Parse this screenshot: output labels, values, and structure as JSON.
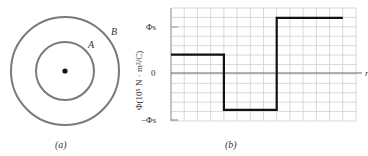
{
  "panel_a": {
    "caption": "(a)",
    "outer_label": "B",
    "inner_label": "A",
    "circle_color": "#777777"
  },
  "panel_b": {
    "caption": "(b)",
    "ylabel": "Φ(10⁵ N · m²/C)",
    "xlabel": "r",
    "ytick_top": "Φs",
    "ytick_zero": "0",
    "ytick_bottom": "−Φs"
  },
  "chart_data": {
    "type": "line",
    "title": "",
    "xlabel": "r",
    "ylabel": "Φ(10^5 N·m²/C)",
    "ytick_labels": [
      "-Φs",
      "0",
      "Φs"
    ],
    "ylim": [
      "-Φs",
      "1.4Φs"
    ],
    "grid": true,
    "step": true,
    "series": [
      {
        "name": "Φ vs r",
        "points_in_units_of_Phi_s": [
          {
            "x_cells": 0,
            "y": 0.4
          },
          {
            "x_cells": 4,
            "y": 0.4
          },
          {
            "x_cells": 4,
            "y": -0.8
          },
          {
            "x_cells": 8,
            "y": -0.8
          },
          {
            "x_cells": 8,
            "y": 1.2
          },
          {
            "x_cells": 13,
            "y": 1.2
          }
        ]
      }
    ]
  }
}
